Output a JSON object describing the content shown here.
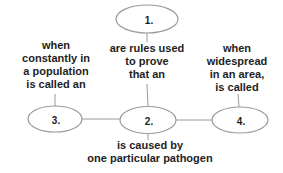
{
  "diagram": {
    "nodes": {
      "n1": {
        "label": "1."
      },
      "n2": {
        "label": "2."
      },
      "n3": {
        "label": "3."
      },
      "n4": {
        "label": "4."
      }
    },
    "edge_labels": {
      "left": "when\nconstantly in\na population\nis called an",
      "middle": "are rules used\nto prove\nthat an",
      "right": "when\nwidespread\nin an area,\nis called",
      "bottom": "is caused by\none particular pathogen"
    },
    "colors": {
      "stroke": "#9a9a9a",
      "text": "#1e1e1e",
      "background": "#ffffff"
    }
  }
}
